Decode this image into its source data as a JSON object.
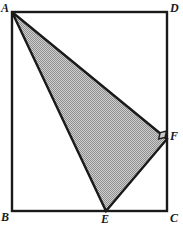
{
  "figure": {
    "canvas": {
      "width": 183,
      "height": 228
    },
    "colors": {
      "background": "#ffffff",
      "stroke": "#1a1a1a",
      "shaded_fill": "#a8a8a8",
      "label_color": "#1a1a1a",
      "right_angle_fill": "#c9c9c9"
    },
    "rectangle": {
      "name": "ABCD",
      "corners": {
        "A": {
          "x": 12,
          "y": 12
        },
        "D": {
          "x": 167,
          "y": 12
        },
        "C": {
          "x": 167,
          "y": 211
        },
        "B": {
          "x": 12,
          "y": 211
        }
      },
      "stroke_width": 2.4
    },
    "triangle": {
      "name": "AEF",
      "shaded": true,
      "fill_pattern": "checkered-gray",
      "stroke_width": 2.4,
      "vertices": {
        "A": {
          "x": 12,
          "y": 12
        },
        "E": {
          "x": 106,
          "y": 211
        },
        "F": {
          "x": 167,
          "y": 139
        }
      }
    },
    "right_angle": {
      "at_vertex": "F",
      "marker": "square",
      "size": 9
    },
    "labels": [
      {
        "id": "A",
        "text": "A",
        "x": 1,
        "y": 2
      },
      {
        "id": "D",
        "text": "D",
        "x": 170,
        "y": 2
      },
      {
        "id": "F",
        "text": "F",
        "x": 170,
        "y": 130
      },
      {
        "id": "B",
        "text": "B",
        "x": 1,
        "y": 211
      },
      {
        "id": "E",
        "text": "E",
        "x": 101,
        "y": 213
      },
      {
        "id": "C",
        "text": "C",
        "x": 170,
        "y": 212
      }
    ]
  }
}
